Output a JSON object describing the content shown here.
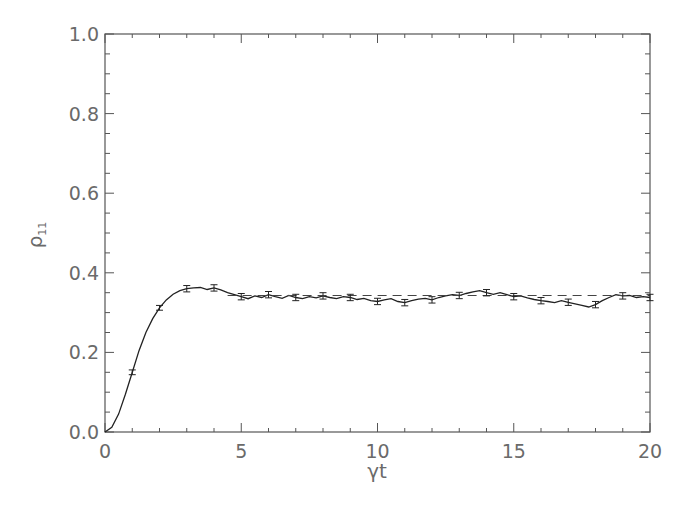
{
  "chart_data": {
    "type": "line",
    "title": "",
    "xlabel": "γt",
    "ylabel": "ρ11",
    "ylabel_main": "ρ",
    "ylabel_sub": "11",
    "xlim": [
      0,
      20
    ],
    "ylim": [
      0.0,
      1.0
    ],
    "xticks": [
      "0",
      "5",
      "10",
      "15",
      "20"
    ],
    "yticks": [
      "0.0",
      "0.2",
      "0.4",
      "0.6",
      "0.8",
      "1.0"
    ],
    "grid": false,
    "legend": null,
    "series": [
      {
        "name": "simulation",
        "style": "solid",
        "x": [
          0,
          0.25,
          0.5,
          0.75,
          1.0,
          1.25,
          1.5,
          1.75,
          2.0,
          2.25,
          2.5,
          2.75,
          3.0,
          3.25,
          3.5,
          3.75,
          4.0,
          4.25,
          4.5,
          4.75,
          5.0,
          5.25,
          5.5,
          5.75,
          6.0,
          6.25,
          6.5,
          6.75,
          7.0,
          7.25,
          7.5,
          7.75,
          8.0,
          8.25,
          8.5,
          8.75,
          9.0,
          9.25,
          9.5,
          9.75,
          10.0,
          10.25,
          10.5,
          10.75,
          11.0,
          11.25,
          11.5,
          11.75,
          12.0,
          12.25,
          12.5,
          12.75,
          13.0,
          13.25,
          13.5,
          13.75,
          14.0,
          14.25,
          14.5,
          14.75,
          15.0,
          15.25,
          15.5,
          15.75,
          16.0,
          16.25,
          16.5,
          16.75,
          17.0,
          17.25,
          17.5,
          17.75,
          18.0,
          18.25,
          18.5,
          18.75,
          19.0,
          19.25,
          19.5,
          19.75,
          20.0
        ],
        "y": [
          0.0,
          0.012,
          0.045,
          0.095,
          0.15,
          0.205,
          0.25,
          0.285,
          0.312,
          0.332,
          0.346,
          0.355,
          0.36,
          0.362,
          0.363,
          0.358,
          0.362,
          0.357,
          0.35,
          0.345,
          0.34,
          0.335,
          0.342,
          0.338,
          0.345,
          0.34,
          0.336,
          0.343,
          0.338,
          0.335,
          0.34,
          0.337,
          0.342,
          0.338,
          0.335,
          0.34,
          0.338,
          0.333,
          0.336,
          0.33,
          0.328,
          0.332,
          0.335,
          0.328,
          0.325,
          0.33,
          0.334,
          0.336,
          0.332,
          0.338,
          0.342,
          0.345,
          0.343,
          0.348,
          0.352,
          0.355,
          0.35,
          0.346,
          0.35,
          0.345,
          0.34,
          0.342,
          0.337,
          0.333,
          0.33,
          0.328,
          0.325,
          0.33,
          0.326,
          0.322,
          0.318,
          0.314,
          0.32,
          0.33,
          0.338,
          0.345,
          0.342,
          0.343,
          0.338,
          0.34,
          0.338
        ]
      },
      {
        "name": "steady-state",
        "style": "dashed",
        "x": [
          4.5,
          20.0
        ],
        "y": [
          0.343,
          0.343
        ]
      }
    ],
    "error_bars": {
      "x": [
        1.0,
        2.0,
        3.0,
        4.0,
        5.0,
        6.0,
        7.0,
        8.0,
        9.0,
        10.0,
        11.0,
        12.0,
        13.0,
        14.0,
        15.0,
        16.0,
        17.0,
        18.0,
        19.0,
        20.0
      ],
      "y": [
        0.15,
        0.312,
        0.36,
        0.362,
        0.34,
        0.345,
        0.338,
        0.342,
        0.338,
        0.328,
        0.325,
        0.332,
        0.343,
        0.35,
        0.34,
        0.33,
        0.326,
        0.32,
        0.342,
        0.338
      ],
      "err": [
        0.006,
        0.006,
        0.008,
        0.008,
        0.008,
        0.008,
        0.008,
        0.008,
        0.008,
        0.008,
        0.008,
        0.008,
        0.008,
        0.008,
        0.008,
        0.008,
        0.008,
        0.008,
        0.008,
        0.008
      ]
    }
  }
}
